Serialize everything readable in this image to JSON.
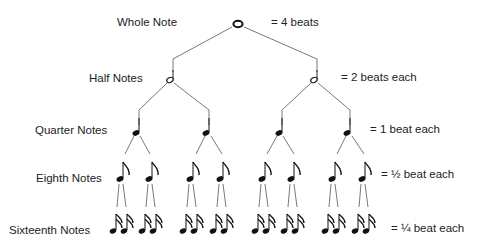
{
  "diagram": {
    "levels": [
      {
        "name": "Whole Note",
        "equals": "= 4 beats",
        "count": 1
      },
      {
        "name": "Half Notes",
        "equals": "= 2 beats each",
        "count": 2
      },
      {
        "name": "Quarter Notes",
        "equals": "= 1 beat each",
        "count": 4
      },
      {
        "name": "Eighth Notes",
        "equals": "= ½ beat each",
        "count": 8
      },
      {
        "name": "Sixteenth Notes",
        "equals": "= ¼ beat each",
        "count": 16
      }
    ]
  },
  "colors": {
    "ink": "#111111",
    "line": "#555555",
    "text": "#222222",
    "background": "#ffffff"
  }
}
